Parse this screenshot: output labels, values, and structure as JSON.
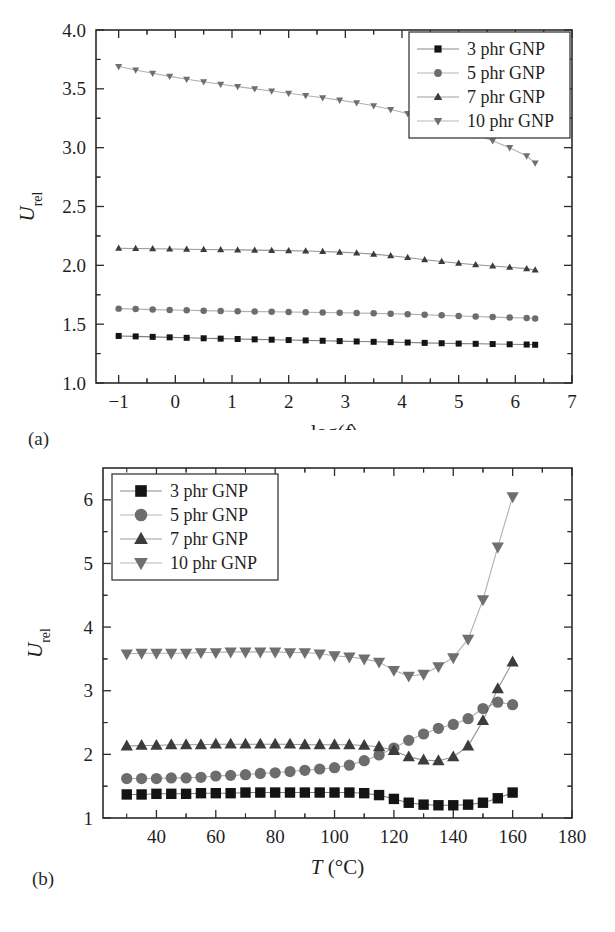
{
  "figure": {
    "panel_a_label": "(a)",
    "panel_b_label": "(b)"
  },
  "chart_data": [
    {
      "id": "panel-a",
      "type": "scatter",
      "title": "",
      "xlabel": "log(f)",
      "ylabel": "U_rel",
      "ylabel_base": "U",
      "ylabel_sub": "rel",
      "xlim": [
        -1.4,
        7.0
      ],
      "ylim": [
        1.0,
        4.0
      ],
      "xticks": [
        -1,
        0,
        1,
        2,
        3,
        4,
        5,
        6,
        7
      ],
      "yticks": [
        1.0,
        1.5,
        2.0,
        2.5,
        3.0,
        3.5,
        4.0
      ],
      "ytick_labels": [
        "1.0",
        "1.5",
        "2.0",
        "2.5",
        "3.0",
        "3.5",
        "4.0"
      ],
      "xtick_labels": [
        "−1",
        "0",
        "1",
        "2",
        "3",
        "4",
        "5",
        "6",
        "7"
      ],
      "grid": false,
      "legend_position": "top-right",
      "x": [
        -1.0,
        -0.7,
        -0.4,
        -0.1,
        0.2,
        0.5,
        0.8,
        1.1,
        1.4,
        1.7,
        2.0,
        2.3,
        2.6,
        2.9,
        3.2,
        3.5,
        3.8,
        4.1,
        4.4,
        4.7,
        5.0,
        5.3,
        5.6,
        5.9,
        6.2,
        6.35
      ],
      "series": [
        {
          "name": "3 phr GNP",
          "marker": "square",
          "color": "#141414",
          "values": [
            1.4,
            1.396,
            1.392,
            1.388,
            1.384,
            1.38,
            1.377,
            1.374,
            1.371,
            1.368,
            1.365,
            1.362,
            1.359,
            1.356,
            1.353,
            1.35,
            1.347,
            1.344,
            1.341,
            1.338,
            1.335,
            1.333,
            1.331,
            1.329,
            1.327,
            1.325
          ]
        },
        {
          "name": "5 phr GNP",
          "marker": "circle",
          "color": "#6d6d6d",
          "values": [
            1.632,
            1.628,
            1.624,
            1.621,
            1.618,
            1.615,
            1.612,
            1.609,
            1.607,
            1.605,
            1.603,
            1.601,
            1.599,
            1.597,
            1.595,
            1.592,
            1.589,
            1.585,
            1.58,
            1.575,
            1.57,
            1.565,
            1.56,
            1.556,
            1.552,
            1.548
          ]
        },
        {
          "name": "7 phr GNP",
          "marker": "triangle-up",
          "color": "#3c3c3c",
          "values": [
            2.145,
            2.143,
            2.141,
            2.139,
            2.137,
            2.135,
            2.133,
            2.131,
            2.129,
            2.127,
            2.125,
            2.122,
            2.118,
            2.112,
            2.105,
            2.095,
            2.082,
            2.066,
            2.048,
            2.032,
            2.018,
            2.005,
            1.994,
            1.984,
            1.972,
            1.96
          ]
        },
        {
          "name": "10 phr GNP",
          "marker": "triangle-down",
          "color": "#6f6f6f",
          "values": [
            3.69,
            3.66,
            3.632,
            3.606,
            3.582,
            3.56,
            3.539,
            3.519,
            3.5,
            3.481,
            3.462,
            3.443,
            3.424,
            3.404,
            3.382,
            3.356,
            3.325,
            3.29,
            3.25,
            3.207,
            3.16,
            3.11,
            3.058,
            3.0,
            2.93,
            2.87
          ]
        }
      ]
    },
    {
      "id": "panel-b",
      "type": "scatter",
      "title": "",
      "xlabel": "T (°C)",
      "ylabel": "U_rel",
      "ylabel_base": "U",
      "ylabel_sub": "rel",
      "xlim": [
        22,
        180
      ],
      "ylim": [
        1,
        6.5
      ],
      "xticks": [
        40,
        60,
        80,
        100,
        120,
        140,
        160,
        180
      ],
      "yticks": [
        1,
        2,
        3,
        4,
        5,
        6
      ],
      "xtick_labels": [
        "40",
        "60",
        "80",
        "100",
        "120",
        "140",
        "160",
        "180"
      ],
      "ytick_labels": [
        "1",
        "2",
        "3",
        "4",
        "5",
        "6"
      ],
      "grid": false,
      "legend_position": "top-left",
      "x": [
        30,
        35,
        40,
        45,
        50,
        55,
        60,
        65,
        70,
        75,
        80,
        85,
        90,
        95,
        100,
        105,
        110,
        115,
        120,
        125,
        130,
        135,
        140,
        145,
        150,
        155,
        160
      ],
      "series": [
        {
          "name": "3 phr GNP",
          "marker": "square",
          "color": "#141414",
          "values": [
            1.37,
            1.37,
            1.38,
            1.38,
            1.38,
            1.39,
            1.39,
            1.39,
            1.4,
            1.4,
            1.4,
            1.4,
            1.4,
            1.4,
            1.4,
            1.4,
            1.39,
            1.36,
            1.3,
            1.24,
            1.21,
            1.2,
            1.2,
            1.21,
            1.24,
            1.31,
            1.4
          ]
        },
        {
          "name": "5 phr GNP",
          "marker": "circle",
          "color": "#6d6d6d",
          "values": [
            1.62,
            1.62,
            1.62,
            1.63,
            1.63,
            1.64,
            1.66,
            1.67,
            1.68,
            1.7,
            1.71,
            1.73,
            1.75,
            1.77,
            1.79,
            1.83,
            1.9,
            1.99,
            2.1,
            2.22,
            2.32,
            2.41,
            2.47,
            2.56,
            2.72,
            2.82,
            2.78
          ]
        },
        {
          "name": "7 phr GNP",
          "marker": "triangle-up",
          "color": "#3c3c3c",
          "values": [
            2.13,
            2.14,
            2.14,
            2.15,
            2.15,
            2.15,
            2.16,
            2.16,
            2.16,
            2.16,
            2.16,
            2.16,
            2.15,
            2.15,
            2.15,
            2.15,
            2.14,
            2.12,
            2.06,
            1.96,
            1.91,
            1.9,
            1.96,
            2.13,
            2.53,
            3.03,
            3.45
          ]
        },
        {
          "name": "10 phr GNP",
          "marker": "triangle-down",
          "color": "#6f6f6f",
          "values": [
            3.58,
            3.59,
            3.59,
            3.59,
            3.59,
            3.6,
            3.6,
            3.61,
            3.61,
            3.61,
            3.61,
            3.6,
            3.6,
            3.58,
            3.55,
            3.53,
            3.5,
            3.45,
            3.32,
            3.23,
            3.26,
            3.38,
            3.52,
            3.81,
            4.43,
            5.26,
            6.05
          ]
        }
      ]
    }
  ]
}
